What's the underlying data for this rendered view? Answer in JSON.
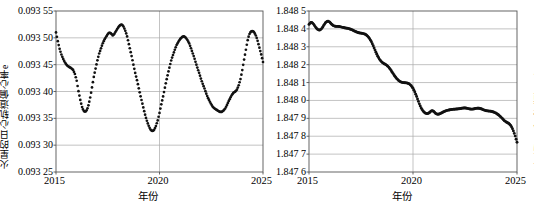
{
  "figure": {
    "panel_count": 2,
    "background": "#ffffff",
    "marker_color": "#111111"
  },
  "chart_data": [
    {
      "type": "scatter",
      "panel": "left",
      "title": "",
      "xlabel": "年份",
      "ylabel": "火星的日心轨道偏心率e",
      "xlim": [
        2015,
        2025
      ],
      "ylim": [
        0.09325,
        0.09355
      ],
      "xticks": [
        "2015",
        "2020",
        "2025"
      ],
      "xtick_values": [
        2015,
        2020,
        2025
      ],
      "yticks": [
        "0.093 55",
        "0.093 50",
        "0.093 45",
        "0.093 40",
        "0.093 35",
        "0.093 30",
        "0.093 25"
      ],
      "ytick_values": [
        0.09355,
        0.0935,
        0.09345,
        0.0934,
        0.09335,
        0.0933,
        0.09325
      ],
      "grid": "horizontal",
      "legend": "none",
      "x": [
        2015.0,
        2015.08,
        2015.17,
        2015.25,
        2015.33,
        2015.42,
        2015.5,
        2015.58,
        2015.67,
        2015.75,
        2015.83,
        2015.92,
        2016.0,
        2016.08,
        2016.17,
        2016.25,
        2016.33,
        2016.42,
        2016.5,
        2016.58,
        2016.67,
        2016.75,
        2016.83,
        2016.92,
        2017.0,
        2017.08,
        2017.17,
        2017.25,
        2017.33,
        2017.42,
        2017.5,
        2017.58,
        2017.67,
        2017.75,
        2017.83,
        2017.92,
        2018.0,
        2018.08,
        2018.17,
        2018.25,
        2018.33,
        2018.42,
        2018.5,
        2018.58,
        2018.67,
        2018.75,
        2018.83,
        2018.92,
        2019.0,
        2019.08,
        2019.17,
        2019.25,
        2019.33,
        2019.42,
        2019.5,
        2019.58,
        2019.67,
        2019.75,
        2019.83,
        2019.92,
        2020.0,
        2020.08,
        2020.17,
        2020.25,
        2020.33,
        2020.42,
        2020.5,
        2020.58,
        2020.67,
        2020.75,
        2020.83,
        2020.92,
        2021.0,
        2021.08,
        2021.17,
        2021.25,
        2021.33,
        2021.42,
        2021.5,
        2021.58,
        2021.67,
        2021.75,
        2021.83,
        2021.92,
        2022.0,
        2022.08,
        2022.17,
        2022.25,
        2022.33,
        2022.42,
        2022.5,
        2022.58,
        2022.67,
        2022.75,
        2022.83,
        2022.92,
        2023.0,
        2023.08,
        2023.17,
        2023.25,
        2023.33,
        2023.42,
        2023.5,
        2023.58,
        2023.67,
        2023.75,
        2023.83,
        2023.92,
        2024.0,
        2024.08,
        2024.17,
        2024.25,
        2024.33,
        2024.42,
        2024.5,
        2024.58,
        2024.67,
        2024.75,
        2024.83,
        2024.92,
        2025.0
      ],
      "y": [
        0.09351,
        0.093495,
        0.09348,
        0.09347,
        0.093462,
        0.093455,
        0.09345,
        0.093447,
        0.093445,
        0.093443,
        0.09344,
        0.093432,
        0.09342,
        0.093402,
        0.093385,
        0.093372,
        0.093364,
        0.093362,
        0.093366,
        0.093376,
        0.093392,
        0.09341,
        0.093428,
        0.093444,
        0.093458,
        0.09347,
        0.09348,
        0.093489,
        0.093496,
        0.093502,
        0.093507,
        0.09351,
        0.093508,
        0.093504,
        0.093508,
        0.093514,
        0.093519,
        0.093523,
        0.093525,
        0.093522,
        0.093515,
        0.093505,
        0.093492,
        0.093478,
        0.093463,
        0.093448,
        0.093434,
        0.09342,
        0.093406,
        0.093392,
        0.093378,
        0.093365,
        0.093353,
        0.093342,
        0.093334,
        0.093328,
        0.093326,
        0.093329,
        0.093336,
        0.093347,
        0.09336,
        0.093375,
        0.09339,
        0.093405,
        0.09342,
        0.093435,
        0.093448,
        0.09346,
        0.09347,
        0.093479,
        0.093487,
        0.093493,
        0.093498,
        0.093501,
        0.093503,
        0.093501,
        0.093497,
        0.093491,
        0.093483,
        0.093474,
        0.093464,
        0.093454,
        0.093444,
        0.093434,
        0.093424,
        0.093415,
        0.093406,
        0.093397,
        0.093389,
        0.093382,
        0.093376,
        0.093371,
        0.093368,
        0.093366,
        0.093364,
        0.093362,
        0.093362,
        0.093364,
        0.093368,
        0.093374,
        0.093381,
        0.093388,
        0.093394,
        0.093398,
        0.0934,
        0.093404,
        0.093412,
        0.093424,
        0.09344,
        0.093458,
        0.093477,
        0.093494,
        0.093506,
        0.093512,
        0.093513,
        0.09351,
        0.093503,
        0.093493,
        0.093481,
        0.093468,
        0.093455
      ]
    },
    {
      "type": "scatter",
      "panel": "right",
      "title": "",
      "xlabel": "年份",
      "ylabel": "火星的日心轨道倾角i(°)",
      "xlim": [
        2015,
        2025
      ],
      "ylim": [
        1.8476,
        1.8485
      ],
      "xticks": [
        "2015",
        "2020",
        "2025"
      ],
      "xtick_values": [
        2015,
        2020,
        2025
      ],
      "yticks": [
        "1.848 5",
        "1.848 4",
        "1.848 3",
        "1.848 2",
        "1.848 1",
        "1.848 0",
        "1.847 9",
        "1.847 8",
        "1.847 7",
        "1.847 6"
      ],
      "ytick_values": [
        1.8485,
        1.8484,
        1.8483,
        1.8482,
        1.8481,
        1.848,
        1.8479,
        1.8478,
        1.8477,
        1.8476
      ],
      "grid": "horizontal",
      "legend": "none",
      "x": [
        2015.0,
        2015.1,
        2015.2,
        2015.3,
        2015.4,
        2015.5,
        2015.6,
        2015.7,
        2015.8,
        2015.9,
        2016.0,
        2016.1,
        2016.2,
        2016.3,
        2016.4,
        2016.5,
        2016.6,
        2016.7,
        2016.8,
        2016.9,
        2017.0,
        2017.1,
        2017.2,
        2017.3,
        2017.4,
        2017.5,
        2017.6,
        2017.7,
        2017.8,
        2017.9,
        2018.0,
        2018.1,
        2018.2,
        2018.3,
        2018.4,
        2018.5,
        2018.6,
        2018.7,
        2018.8,
        2018.9,
        2019.0,
        2019.1,
        2019.2,
        2019.3,
        2019.4,
        2019.5,
        2019.6,
        2019.7,
        2019.8,
        2019.9,
        2020.0,
        2020.1,
        2020.2,
        2020.3,
        2020.4,
        2020.5,
        2020.6,
        2020.7,
        2020.8,
        2020.9,
        2021.0,
        2021.1,
        2021.2,
        2021.3,
        2021.4,
        2021.5,
        2021.6,
        2021.7,
        2021.8,
        2021.9,
        2022.0,
        2022.1,
        2022.2,
        2022.3,
        2022.4,
        2022.5,
        2022.6,
        2022.7,
        2022.8,
        2022.9,
        2023.0,
        2023.1,
        2023.2,
        2023.3,
        2023.4,
        2023.5,
        2023.6,
        2023.7,
        2023.8,
        2023.9,
        2024.0,
        2024.1,
        2024.2,
        2024.3,
        2024.4,
        2024.5,
        2024.6,
        2024.7,
        2024.8,
        2024.9,
        2025.0
      ],
      "y": [
        1.848425,
        1.848438,
        1.84843,
        1.848412,
        1.848398,
        1.848392,
        1.8484,
        1.848418,
        1.848436,
        1.848444,
        1.848438,
        1.848424,
        1.848416,
        1.848414,
        1.848414,
        1.848412,
        1.848409,
        1.848406,
        1.848404,
        1.848402,
        1.848398,
        1.848393,
        1.848387,
        1.848382,
        1.848378,
        1.848376,
        1.848374,
        1.84837,
        1.848362,
        1.848348,
        1.848328,
        1.848302,
        1.848274,
        1.848248,
        1.848228,
        1.848214,
        1.848206,
        1.8482,
        1.84819,
        1.848176,
        1.848158,
        1.84814,
        1.848124,
        1.848112,
        1.848104,
        1.8481,
        1.848099,
        1.848098,
        1.848094,
        1.848084,
        1.848068,
        1.848044,
        1.848014,
        1.847982,
        1.847956,
        1.847938,
        1.847928,
        1.847926,
        1.847932,
        1.847944,
        1.847938,
        1.847926,
        1.847922,
        1.847926,
        1.847932,
        1.847938,
        1.847943,
        1.847946,
        1.847948,
        1.84795,
        1.847951,
        1.847952,
        1.847953,
        1.847955,
        1.847957,
        1.847958,
        1.847956,
        1.847953,
        1.847951,
        1.847952,
        1.847955,
        1.847957,
        1.847956,
        1.847952,
        1.847947,
        1.847943,
        1.847941,
        1.84794,
        1.847938,
        1.847934,
        1.847928,
        1.84792,
        1.84791,
        1.847898,
        1.847886,
        1.847878,
        1.847872,
        1.84786,
        1.847838,
        1.847806,
        1.847766
      ]
    }
  ]
}
